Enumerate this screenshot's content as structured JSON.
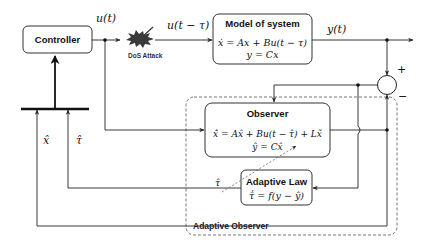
{
  "diagram": {
    "type": "block-diagram",
    "blocks": {
      "controller": {
        "title": "Controller"
      },
      "model": {
        "title": "Model of system",
        "eq1": "ẋ = Ax + Bu(t − τ)",
        "eq2": "y = Cx"
      },
      "observer": {
        "title": "Observer",
        "eq1": "x̂̇ = Ax̂ + Bu(t − τ̂) + Lx̃",
        "eq2": "ŷ = Cx̂"
      },
      "adaptive_law": {
        "title": "Adaptive Law",
        "eq1": "τ̂̇ = f(y − ŷ)"
      }
    },
    "signals": {
      "u": "u(t)",
      "u_delayed": "u(t − τ)",
      "y": "y(t)",
      "x_hat": "x̂",
      "tau_hat": "τ̂",
      "tau_hat_inner": "τ̂"
    },
    "summing_junction": {
      "plus": "+",
      "minus": "−"
    },
    "attack": {
      "label": "DoS Attack",
      "color": "#3a3a3a"
    },
    "region": {
      "label": "Adaptive Observer"
    },
    "colors": {
      "line": "#222222",
      "dashed": "#666666",
      "box_stroke": "#333333"
    }
  }
}
